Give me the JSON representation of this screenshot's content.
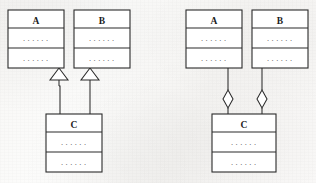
{
  "figure": {
    "background_color": "#f8f7f5",
    "ink_color": "#2b2b2b",
    "box_fill": "#ffffff"
  },
  "diagrams": [
    {
      "id": "left",
      "relationship": "generalization",
      "connector_end_shape": "hollow-triangle",
      "classes": [
        {
          "id": "left-a",
          "name": "A",
          "attributes": "......",
          "operations": "......",
          "x": 8,
          "y": 10,
          "w": 56,
          "h": 58
        },
        {
          "id": "left-b",
          "name": "B",
          "attributes": "......",
          "operations": "......",
          "x": 74,
          "y": 10,
          "w": 56,
          "h": 58
        },
        {
          "id": "left-c",
          "name": "C",
          "attributes": "......",
          "operations": "......",
          "x": 46,
          "y": 114,
          "w": 56,
          "h": 58
        }
      ],
      "connectors": [
        {
          "id": "left-c-to-a",
          "from": "left-c",
          "to": "left-a",
          "end_shape": "hollow-triangle"
        },
        {
          "id": "left-c-to-b",
          "from": "left-c",
          "to": "left-b",
          "end_shape": "hollow-triangle"
        }
      ]
    },
    {
      "id": "right",
      "relationship": "aggregation",
      "connector_end_shape": "hollow-diamond",
      "classes": [
        {
          "id": "right-a",
          "name": "A",
          "attributes": "......",
          "operations": "......",
          "x": 186,
          "y": 10,
          "w": 56,
          "h": 58
        },
        {
          "id": "right-b",
          "name": "B",
          "attributes": "......",
          "operations": "......",
          "x": 252,
          "y": 10,
          "w": 56,
          "h": 58
        },
        {
          "id": "right-c",
          "name": "C",
          "attributes": "......",
          "operations": "......",
          "x": 212,
          "y": 114,
          "w": 64,
          "h": 58
        }
      ],
      "connectors": [
        {
          "id": "right-a-to-c",
          "from": "right-a",
          "to": "right-c",
          "end_shape": "hollow-diamond"
        },
        {
          "id": "right-b-to-c",
          "from": "right-b",
          "to": "right-c",
          "end_shape": "hollow-diamond"
        }
      ]
    }
  ]
}
